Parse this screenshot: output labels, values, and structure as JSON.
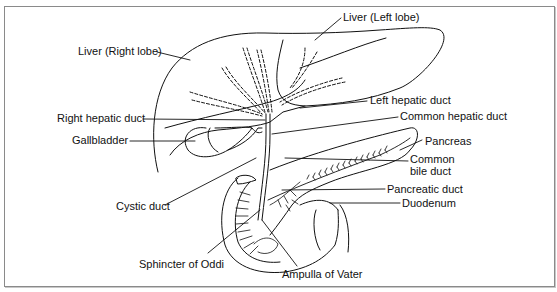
{
  "diagram": {
    "type": "anatomical",
    "colors": {
      "line": "#111111",
      "frame": "#8a8a8a",
      "background": "#ffffff"
    },
    "labels": {
      "liver_right": "Liver (Right lobe)",
      "liver_left": "Liver (Left lobe)",
      "left_hepatic": "Left hepatic duct",
      "right_hepatic": "Right hepatic duct",
      "common_hepatic": "Common hepatic duct",
      "gallbladder": "Gallbladder",
      "pancreas": "Pancreas",
      "common_bile_1": "Common",
      "common_bile_2": "bile duct",
      "pancreatic_duct": "Pancreatic duct",
      "duodenum": "Duodenum",
      "cystic_duct": "Cystic duct",
      "sphincter": "Sphincter of Oddi",
      "ampulla": "Ampulla of Vater"
    }
  }
}
